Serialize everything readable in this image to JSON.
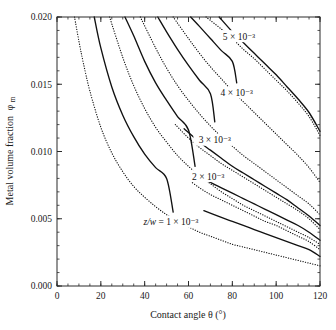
{
  "chart_data": {
    "type": "line",
    "title": "",
    "xlabel": "Contact angle θ (°)",
    "ylabel": "Metal volume fraction φm",
    "xlim": [
      0,
      120
    ],
    "ylim": [
      0.0,
      0.02
    ],
    "grid": false,
    "legend_position": "inline-annotations",
    "x_ticks": [
      "0",
      "20",
      "40",
      "60",
      "80",
      "100",
      "120"
    ],
    "x_tick_values": [
      0,
      20,
      40,
      60,
      80,
      100,
      120
    ],
    "x_minor_step": 5,
    "y_ticks": [
      "0.000",
      "0.005",
      "0.010",
      "0.015",
      "0.020"
    ],
    "y_tick_values": [
      0.0,
      0.005,
      0.01,
      0.015,
      0.02
    ],
    "y_minor_step": 0.001,
    "series": [
      {
        "name": "z/w = 1 × 10⁻³",
        "style": "dotted",
        "z_over_w": 0.001,
        "x": [
          8,
          10,
          12,
          15,
          20,
          25,
          30,
          35,
          40,
          45,
          50,
          55,
          60,
          65,
          70,
          75,
          80,
          85,
          90,
          95,
          100,
          105,
          110,
          115,
          120
        ],
        "y": [
          0.02,
          0.0182,
          0.0166,
          0.0145,
          0.0118,
          0.0099,
          0.0085,
          0.0074,
          0.0066,
          0.0059,
          0.0053,
          0.0048,
          0.0044,
          0.004,
          0.0037,
          0.0034,
          0.0031,
          0.0029,
          0.0027,
          0.0025,
          0.0023,
          0.0021,
          0.0019,
          0.0017,
          0.0015
        ]
      },
      {
        "name": "1.5 × 10⁻³",
        "style": "solid",
        "z_over_w": 0.0015,
        "x": [
          17,
          20,
          25,
          30,
          35,
          40,
          45,
          50,
          53
        ],
        "y": [
          0.02,
          0.0177,
          0.0148,
          0.0127,
          0.0111,
          0.0098,
          0.0088,
          0.008,
          0.0055
        ]
      },
      {
        "name": "2 × 10⁻³",
        "style": "dotted",
        "z_over_w": 0.002,
        "x": [
          24,
          30,
          35,
          40,
          45,
          50,
          55,
          60,
          65,
          70,
          75,
          80,
          85,
          90,
          95,
          100,
          105,
          110,
          115,
          120
        ],
        "y": [
          0.02,
          0.017,
          0.0149,
          0.0132,
          0.0118,
          0.0107,
          0.0097,
          0.0089,
          0.0082,
          0.0076,
          0.007,
          0.0065,
          0.006,
          0.0056,
          0.0052,
          0.0048,
          0.0044,
          0.004,
          0.0036,
          0.0031
        ]
      },
      {
        "name": "2.5 × 10⁻³",
        "style": "solid",
        "z_over_w": 0.0025,
        "x": [
          31,
          35,
          40,
          45,
          50,
          55,
          60,
          63
        ],
        "y": [
          0.02,
          0.0186,
          0.0167,
          0.0151,
          0.0138,
          0.0126,
          0.0116,
          0.0089
        ]
      },
      {
        "name": "3 × 10⁻³",
        "style": "dotted",
        "z_over_w": 0.003,
        "x": [
          38,
          45,
          50,
          55,
          60,
          65,
          70,
          75,
          80,
          85,
          90,
          95,
          100,
          105,
          110,
          115,
          120
        ],
        "y": [
          0.02,
          0.0177,
          0.0162,
          0.0149,
          0.0138,
          0.0128,
          0.0119,
          0.0111,
          0.0104,
          0.0097,
          0.0091,
          0.0085,
          0.0079,
          0.0073,
          0.0067,
          0.0061,
          0.0053
        ]
      },
      {
        "name": "3.5 × 10⁻³",
        "style": "solid",
        "z_over_w": 0.0035,
        "x": [
          46,
          50,
          55,
          60,
          65,
          70,
          72
        ],
        "y": [
          0.02,
          0.0189,
          0.0176,
          0.0164,
          0.0153,
          0.0143,
          0.0122
        ]
      },
      {
        "name": "4 × 10⁻³",
        "style": "dotted",
        "z_over_w": 0.004,
        "x": [
          53,
          60,
          65,
          70,
          75,
          80,
          85,
          90,
          95,
          100,
          105,
          110,
          115,
          120
        ],
        "y": [
          0.02,
          0.0184,
          0.0173,
          0.0163,
          0.0154,
          0.0145,
          0.0137,
          0.0129,
          0.0121,
          0.0113,
          0.0105,
          0.0097,
          0.0088,
          0.0077
        ]
      },
      {
        "name": "4.5 × 10⁻³",
        "style": "solid",
        "z_over_w": 0.0045,
        "x": [
          61,
          65,
          70,
          75,
          80,
          82
        ],
        "y": [
          0.02,
          0.0193,
          0.0184,
          0.0175,
          0.0167,
          0.0151
        ]
      },
      {
        "name": "5 × 10⁻³",
        "style": "dotted",
        "z_over_w": 0.005,
        "x": [
          68,
          75,
          80,
          85,
          90,
          95,
          100,
          105,
          110,
          115,
          120
        ],
        "y": [
          0.02,
          0.0191,
          0.0184,
          0.0176,
          0.0169,
          0.0161,
          0.0153,
          0.0145,
          0.0136,
          0.0126,
          0.0112
        ]
      },
      {
        "name": "5.5 × 10⁻³ upper-solid-a",
        "style": "solid",
        "z_over_w": 0.0055,
        "x": [
          74,
          80,
          85,
          90,
          95,
          100,
          105,
          110,
          115,
          120
        ],
        "y": [
          0.02,
          0.0189,
          0.0181,
          0.0173,
          0.0165,
          0.0157,
          0.0148,
          0.0139,
          0.0129,
          0.0115
        ]
      },
      {
        "name": "lower-solid-b",
        "style": "solid",
        "z_over_w": 0.0018,
        "x": [
          63,
          70,
          75,
          80,
          85,
          90,
          95,
          100,
          105,
          110,
          115,
          120
        ],
        "y": [
          0.0084,
          0.0077,
          0.0073,
          0.0069,
          0.0065,
          0.0061,
          0.0057,
          0.0053,
          0.0049,
          0.0045,
          0.004,
          0.0034
        ]
      },
      {
        "name": "lower-solid-c",
        "style": "solid",
        "z_over_w": 0.0012,
        "x": [
          67,
          75,
          80,
          85,
          90,
          95,
          100,
          105,
          110,
          115,
          120
        ],
        "y": [
          0.0056,
          0.0051,
          0.0048,
          0.0045,
          0.0042,
          0.0039,
          0.0036,
          0.0033,
          0.003,
          0.0027,
          0.0022
        ]
      },
      {
        "name": "lower-dotted-d",
        "style": "dotted",
        "z_over_w": 0.0016,
        "x": [
          60,
          65,
          70,
          75,
          80,
          85,
          90,
          95,
          100,
          105,
          110,
          115,
          120
        ],
        "y": [
          0.0079,
          0.0073,
          0.0068,
          0.0064,
          0.006,
          0.0056,
          0.0052,
          0.0048,
          0.0045,
          0.0041,
          0.0037,
          0.0033,
          0.0027
        ]
      },
      {
        "name": "mid-solid-e",
        "style": "solid",
        "z_over_w": 0.0028,
        "x": [
          58,
          65,
          70,
          75,
          80,
          85,
          90,
          95,
          100,
          105,
          110,
          115,
          120
        ],
        "y": [
          0.0117,
          0.0107,
          0.0101,
          0.0095,
          0.0089,
          0.0084,
          0.0079,
          0.0074,
          0.0069,
          0.0064,
          0.0058,
          0.0052,
          0.0045
        ]
      },
      {
        "name": "mid-dotted-f",
        "style": "dotted",
        "z_over_w": 0.0024,
        "x": [
          54,
          60,
          65,
          70,
          75,
          80,
          85,
          90,
          95,
          100,
          105,
          110,
          115,
          120
        ],
        "y": [
          0.012,
          0.011,
          0.0103,
          0.0097,
          0.0091,
          0.0086,
          0.0081,
          0.0076,
          0.0071,
          0.0066,
          0.0061,
          0.0056,
          0.005,
          0.0042
        ]
      }
    ],
    "annotations": [
      {
        "id": "label-5e-3",
        "text": "5 × 10⁻³",
        "x": 83,
        "y": 0.0185
      },
      {
        "id": "label-4e-3",
        "text": "4 × 10⁻³",
        "x": 82,
        "y": 0.0143
      },
      {
        "id": "label-3e-3",
        "text": "3 × 10⁻³",
        "x": 72,
        "y": 0.0108
      },
      {
        "id": "label-2e-3",
        "text": "2 × 10⁻³",
        "x": 69,
        "y": 0.0081
      },
      {
        "id": "label-1e-3",
        "text": "z/w = 1 × 10⁻³",
        "x": 52,
        "y": 0.0047
      }
    ]
  },
  "axes": {
    "x_title": "Contact angle θ (°)",
    "y_title_main": "Metal volume fraction",
    "y_title_symbol": "φ",
    "y_title_subscript": "m",
    "x_tick_labels": [
      "0",
      "20",
      "40",
      "60",
      "80",
      "100",
      "120"
    ],
    "y_tick_labels": [
      "0.000",
      "0.005",
      "0.010",
      "0.015",
      "0.020"
    ]
  },
  "annotations_text": {
    "a5": "5 × 10⁻³",
    "a4": "4 × 10⁻³",
    "a3": "3 × 10⁻³",
    "a2": "2 × 10⁻³",
    "a1_prefix": "z/w",
    "a1_rest": " = 1 × 10⁻³"
  },
  "colors": {
    "ink": "#111111",
    "axis": "#2a2a2a",
    "background": "#ffffff"
  }
}
